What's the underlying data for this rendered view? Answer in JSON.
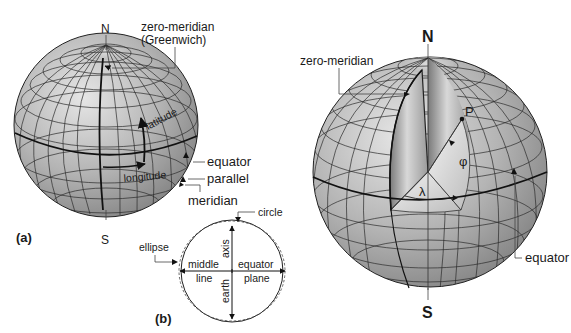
{
  "figure": {
    "background": "#ffffff",
    "sphere_fill": "#a8a8a8",
    "line_color": "#222222"
  },
  "panel_a": {
    "label": "(a)",
    "north": "N",
    "south": "S",
    "zero_meridian_line1": "zero-meridian",
    "zero_meridian_line2": "(Greenwich)",
    "latitude": "latitude",
    "longitude": "longitude",
    "equator": "equator",
    "parallel": "parallel",
    "meridian": "meridian"
  },
  "panel_b": {
    "label": "(b)",
    "circle": "circle",
    "ellipse": "ellipse",
    "axis": "axis",
    "earth": "earth",
    "middle": "middle",
    "line": "line",
    "equator": "equator",
    "plane": "plane"
  },
  "panel_c": {
    "north": "N",
    "south": "S",
    "zero_meridian": "zero-meridian",
    "point": "P",
    "phi": "φ",
    "lambda": "λ",
    "equator": "equator"
  }
}
